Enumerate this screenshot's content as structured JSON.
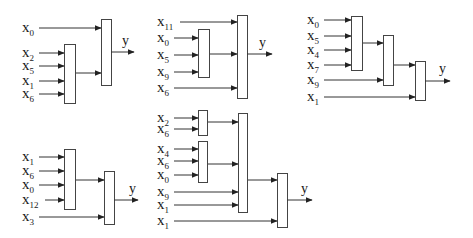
{
  "output_label": "y",
  "colors": {
    "stroke": "#444444",
    "text": "#1a1a1a",
    "background": "#ffffff"
  },
  "diagrams": [
    {
      "id": "d1",
      "inputs": [
        {
          "base": "x",
          "sub": "0",
          "lx": 22,
          "y": 28,
          "to_x": 101
        },
        {
          "base": "x",
          "sub": "2",
          "lx": 22,
          "y": 53,
          "to_x": 64
        },
        {
          "base": "x",
          "sub": "5",
          "lx": 22,
          "y": 66,
          "to_x": 64
        },
        {
          "base": "x",
          "sub": "1",
          "lx": 22,
          "y": 81,
          "to_x": 64
        },
        {
          "base": "x",
          "sub": "6",
          "lx": 22,
          "y": 94,
          "to_x": 64
        }
      ],
      "boxes": [
        {
          "x": 64,
          "y": 44,
          "w": 11,
          "h": 59
        },
        {
          "x": 101,
          "y": 19,
          "w": 10,
          "h": 66
        }
      ],
      "links": [
        {
          "x1": 75,
          "x2": 101,
          "y": 73
        }
      ],
      "output": {
        "x1": 111,
        "x2": 134,
        "y": 52,
        "lx": 122,
        "ly": 45
      }
    },
    {
      "id": "d2",
      "inputs": [
        {
          "base": "x",
          "sub": "11",
          "lx": 157,
          "y": 22,
          "to_x": 237
        },
        {
          "base": "x",
          "sub": "0",
          "lx": 157,
          "y": 38,
          "to_x": 198
        },
        {
          "base": "x",
          "sub": "5",
          "lx": 157,
          "y": 55,
          "to_x": 198
        },
        {
          "base": "x",
          "sub": "9",
          "lx": 157,
          "y": 72,
          "to_x": 198
        },
        {
          "base": "x",
          "sub": "6",
          "lx": 157,
          "y": 88,
          "to_x": 237
        }
      ],
      "boxes": [
        {
          "x": 198,
          "y": 29,
          "w": 11,
          "h": 48
        },
        {
          "x": 237,
          "y": 15,
          "w": 10,
          "h": 83
        }
      ],
      "links": [
        {
          "x1": 209,
          "x2": 237,
          "y": 54
        }
      ],
      "output": {
        "x1": 247,
        "x2": 272,
        "y": 54,
        "lx": 259,
        "ly": 47
      }
    },
    {
      "id": "d3",
      "inputs": [
        {
          "base": "x",
          "sub": "0",
          "lx": 307,
          "y": 20,
          "to_x": 351
        },
        {
          "base": "x",
          "sub": "5",
          "lx": 307,
          "y": 36,
          "to_x": 351
        },
        {
          "base": "x",
          "sub": "4",
          "lx": 307,
          "y": 50,
          "to_x": 351
        },
        {
          "base": "x",
          "sub": "7",
          "lx": 307,
          "y": 65,
          "to_x": 351
        },
        {
          "base": "x",
          "sub": "9",
          "lx": 307,
          "y": 80,
          "to_x": 383
        },
        {
          "base": "x",
          "sub": "1",
          "lx": 307,
          "y": 97,
          "to_x": 415
        }
      ],
      "boxes": [
        {
          "x": 351,
          "y": 16,
          "w": 11,
          "h": 54
        },
        {
          "x": 383,
          "y": 35,
          "w": 10,
          "h": 50
        },
        {
          "x": 415,
          "y": 61,
          "w": 10,
          "h": 39
        }
      ],
      "links": [
        {
          "x1": 362,
          "x2": 383,
          "y": 43
        },
        {
          "x1": 393,
          "x2": 415,
          "y": 65
        }
      ],
      "output": {
        "x1": 425,
        "x2": 450,
        "y": 81,
        "lx": 439,
        "ly": 73
      }
    },
    {
      "id": "d4",
      "inputs": [
        {
          "base": "x",
          "sub": "1",
          "lx": 22,
          "y": 157,
          "to_x": 64
        },
        {
          "base": "x",
          "sub": "6",
          "lx": 22,
          "y": 171,
          "to_x": 64
        },
        {
          "base": "x",
          "sub": "0",
          "lx": 22,
          "y": 185,
          "to_x": 64
        },
        {
          "base": "x",
          "sub": "12",
          "lx": 22,
          "y": 200,
          "to_x": 64
        },
        {
          "base": "x",
          "sub": "3",
          "lx": 22,
          "y": 217,
          "to_x": 104
        }
      ],
      "boxes": [
        {
          "x": 64,
          "y": 149,
          "w": 11,
          "h": 60
        },
        {
          "x": 104,
          "y": 171,
          "w": 10,
          "h": 53
        }
      ],
      "links": [
        {
          "x1": 75,
          "x2": 104,
          "y": 180
        }
      ],
      "output": {
        "x1": 114,
        "x2": 138,
        "y": 200,
        "lx": 129,
        "ly": 193
      }
    },
    {
      "id": "d5",
      "inputs": [
        {
          "base": "x",
          "sub": "2",
          "lx": 157,
          "y": 118,
          "to_x": 198
        },
        {
          "base": "x",
          "sub": "6",
          "lx": 157,
          "y": 129,
          "to_x": 198
        },
        {
          "base": "x",
          "sub": "4",
          "lx": 157,
          "y": 149,
          "to_x": 198
        },
        {
          "base": "x",
          "sub": "6",
          "lx": 157,
          "y": 161,
          "to_x": 198
        },
        {
          "base": "x",
          "sub": "0",
          "lx": 157,
          "y": 175,
          "to_x": 198
        },
        {
          "base": "x",
          "sub": "9",
          "lx": 157,
          "y": 192,
          "to_x": 238
        },
        {
          "base": "x",
          "sub": "1",
          "lx": 157,
          "y": 205,
          "to_x": 238
        },
        {
          "base": "x",
          "sub": "1",
          "lx": 157,
          "y": 221,
          "to_x": 277
        }
      ],
      "boxes": [
        {
          "x": 198,
          "y": 110,
          "w": 9,
          "h": 25
        },
        {
          "x": 198,
          "y": 141,
          "w": 9,
          "h": 41
        },
        {
          "x": 238,
          "y": 113,
          "w": 9,
          "h": 99
        },
        {
          "x": 277,
          "y": 173,
          "w": 10,
          "h": 54
        }
      ],
      "links": [
        {
          "x1": 207,
          "x2": 238,
          "y": 122
        },
        {
          "x1": 207,
          "x2": 238,
          "y": 164
        },
        {
          "x1": 247,
          "x2": 277,
          "y": 180
        }
      ],
      "output": {
        "x1": 287,
        "x2": 312,
        "y": 200,
        "lx": 301,
        "ly": 193
      }
    }
  ]
}
